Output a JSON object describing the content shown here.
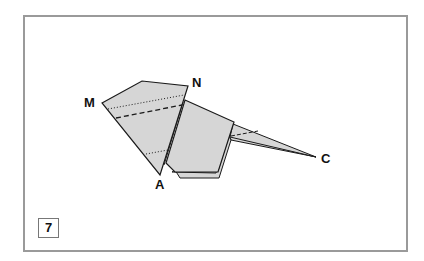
{
  "diagram": {
    "type": "origami-step",
    "step_number": "7",
    "points": {
      "M": "M",
      "N": "N",
      "A": "A",
      "C": "C"
    },
    "colors": {
      "paper": "#d6d6d6",
      "outline": "#1a1a1a",
      "frame": "#9a9a9a"
    },
    "lines": {
      "mountain_fold": "dotted",
      "valley_fold": "dashed"
    }
  }
}
